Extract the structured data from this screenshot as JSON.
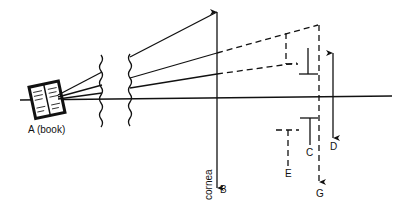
{
  "diagram": {
    "type": "optics-ray-diagram",
    "labels": {
      "book": "A (book)",
      "cornea": "cornea",
      "B": "B",
      "C": "C",
      "D": "D",
      "E": "E",
      "G": "G"
    },
    "elements": [
      {
        "id": "A",
        "description": "book object emitting rays"
      },
      {
        "id": "B",
        "description": "cornea plane arrow"
      },
      {
        "id": "C",
        "description": "solid T-shaped marks above and below axis"
      },
      {
        "id": "D",
        "description": "double-headed vertical arrow"
      },
      {
        "id": "E",
        "description": "dashed T-shaped mark"
      },
      {
        "id": "G",
        "description": "dashed vertical arrow"
      }
    ],
    "colors": {
      "ink": "#111111",
      "background": "#ffffff"
    }
  }
}
